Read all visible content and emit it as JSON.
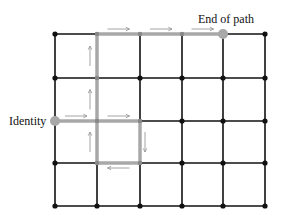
{
  "diagram": {
    "grid": {
      "columns": 6,
      "rows": 5,
      "line_color": "#111111",
      "node_color": "#111111"
    },
    "path": {
      "color": "#a8a8a8",
      "arrow_color": "#9a9a9a",
      "nodes": [
        [
          0,
          2
        ],
        [
          1,
          2
        ],
        [
          2,
          2
        ],
        [
          2,
          3
        ],
        [
          1,
          3
        ],
        [
          1,
          2
        ],
        [
          1,
          1
        ],
        [
          1,
          0
        ],
        [
          2,
          0
        ],
        [
          3,
          0
        ],
        [
          4,
          0
        ]
      ]
    },
    "labels": {
      "start": "Identity",
      "end": "End of path"
    }
  }
}
